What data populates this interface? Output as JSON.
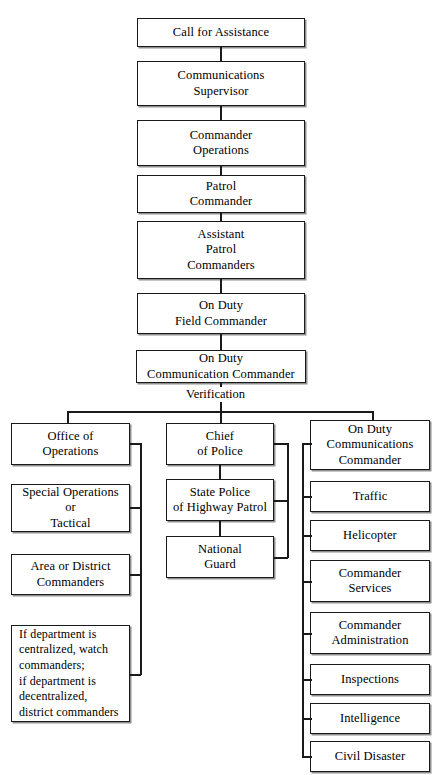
{
  "diagram": {
    "type": "organizational-flowchart",
    "colors": {
      "box_border": "#1a1a1a",
      "box_fill": "#ffffff",
      "connector": "#1a1a1a",
      "shadow": "#8f8f8f",
      "text": "#000000"
    },
    "chain": [
      {
        "id": "call-for-assistance",
        "label": "Call for Assistance"
      },
      {
        "id": "communications-supervisor",
        "label": "Communications\nSupervisor"
      },
      {
        "id": "commander-operations",
        "label": "Commander\nOperations"
      },
      {
        "id": "patrol-commander",
        "label": "Patrol\nCommander"
      },
      {
        "id": "assistant-patrol-commanders",
        "label": "Assistant\nPatrol\nCommanders"
      },
      {
        "id": "on-duty-field-commander",
        "label": "On Duty\nField Commander"
      },
      {
        "id": "on-duty-communication-commander",
        "label": "On Duty\nCommunication Commander"
      }
    ],
    "connector_label": "Verification",
    "columns": {
      "left": {
        "name": "operations-branch",
        "items": [
          {
            "id": "office-of-operations",
            "label": "Office of\nOperations",
            "align": "center"
          },
          {
            "id": "special-operations-or-tactical",
            "label": "Special Operations\nor\nTactical",
            "align": "center"
          },
          {
            "id": "area-or-district-commanders",
            "label": "Area or District\nCommanders",
            "align": "center"
          },
          {
            "id": "watch-or-district-commanders-note",
            "label": "If department is\ncentralized, watch\ncommanders;\nif department is\ndecentralized,\ndistrict commanders",
            "align": "left"
          }
        ]
      },
      "center": {
        "name": "chief-of-police-branch",
        "items": [
          {
            "id": "chief-of-police",
            "label": "Chief\nof Police",
            "align": "center"
          },
          {
            "id": "state-police-of-highway-patrol",
            "label": "State Police\nof Highway Patrol",
            "align": "center"
          },
          {
            "id": "national-guard",
            "label": "National\nGuard",
            "align": "center"
          }
        ]
      },
      "right": {
        "name": "communications-branch",
        "items": [
          {
            "id": "on-duty-communications-commander",
            "label": "On Duty\nCommunications\nCommander",
            "align": "center"
          },
          {
            "id": "traffic",
            "label": "Traffic",
            "align": "center"
          },
          {
            "id": "helicopter",
            "label": "Helicopter",
            "align": "center"
          },
          {
            "id": "commander-services",
            "label": "Commander\nServices",
            "align": "center"
          },
          {
            "id": "commander-administration",
            "label": "Commander\nAdministration",
            "align": "center"
          },
          {
            "id": "inspections",
            "label": "Inspections",
            "align": "center"
          },
          {
            "id": "intelligence",
            "label": "Intelligence",
            "align": "center"
          },
          {
            "id": "civil-disaster",
            "label": "Civil Disaster",
            "align": "center"
          }
        ]
      }
    }
  }
}
